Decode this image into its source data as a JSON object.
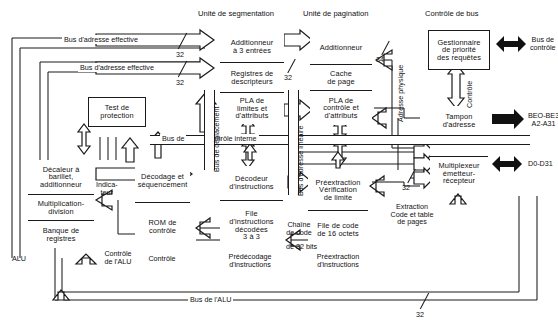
{
  "diagram": {
    "section_titles": {
      "segmentation": "Unité de segmentation",
      "pagination": "Unité de pagination",
      "bus_control": "Contrôle de bus"
    },
    "blocks": {
      "alu": {
        "shifter": "Décaleur à barillet, additionneur",
        "shifter_l1": "Décaleur à",
        "shifter_l2": "barillet,",
        "shifter_l3": "additionneur",
        "muldiv_l1": "Multiplication-",
        "muldiv_l2": "division",
        "regbank_l1": "Banque de",
        "regbank_l2": "registres",
        "caption": "ALU"
      },
      "protection": {
        "l1": "Test de",
        "l2": "protection"
      },
      "control": {
        "decode_l1": "Décodage et",
        "decode_l2": "séquencement",
        "rom_l1": "ROM de",
        "rom_l2": "contrôle",
        "caption": "Contrôle"
      },
      "instruction_decode": {
        "decoder_l1": "Décodeur",
        "decoder_l2": "d'instructions",
        "queue_l1": "File",
        "queue_l2": "d'instructions",
        "queue_l3": "décodées",
        "queue_l4": "3 à 3",
        "caption_l1": "Prédécodage",
        "caption_l2": "d'instructions"
      },
      "prefetch": {
        "limit_l1": "Préextraction",
        "limit_l2": "Vérification",
        "limit_l3": "de limite",
        "codequeue_l1": "File de code",
        "codequeue_l2": "de 16 octets",
        "caption_l1": "Préextraction",
        "caption_l2": "d'instructions"
      },
      "segmentation": {
        "adder_l1": "Additionneur",
        "adder_l2": "à 3 entrées",
        "descr_l1": "Registres de",
        "descr_l2": "descripteurs",
        "pla_l1": "PLA de",
        "pla_l2": "limites et",
        "pla_l3": "d'attributs"
      },
      "pagination": {
        "adder": "Additionneur",
        "cache_l1": "Cache",
        "cache_l2": "de page",
        "pla_l1": "PLA de",
        "pla_l2": "contrôle et",
        "pla_l3": "d'attributs"
      },
      "bus": {
        "requests_l1": "Gestionnaire",
        "requests_l2": "de priorité",
        "requests_l3": "des requêtes",
        "addrbuf_l1": "Tampon",
        "addrbuf_l2": "d'adresse",
        "spacer": "",
        "mux_l1": "Multiplexeur",
        "mux_l2": "émetteur-",
        "mux_l3": "récepteur"
      }
    },
    "bus_labels": {
      "effective_address_1": "Bus d'adresse effective",
      "effective_address_2": "Bus d'adresse effective",
      "internal_control": "Bus de       contrôle interne",
      "internal_control_a": "Bus de",
      "internal_control_b": "contrôle interne",
      "displacement": "Bus de déplacement",
      "linear_address": "Bus d'adresse linéaire",
      "physical_address": "Adresse physique",
      "control_vertical": "Contrôle",
      "alu_bus": "Bus de l'ALU"
    },
    "misc_labels": {
      "indicator_l1": "Indica-",
      "indicator_l2": "teur",
      "alu_control_l1": "Contrôle",
      "alu_control_l2": "de l'ALU",
      "code_chain_l1": "Chaîne",
      "code_chain_l2": "de code",
      "code_chain_l3": "de 32 bits",
      "extraction_l1": "Extraction",
      "extraction_l2": "Code et table",
      "extraction_l3": "de pages"
    },
    "external_signals": {
      "control_bus_l1": "Bus de",
      "control_bus_l2": "contrôle",
      "address_bus_l1": "BEO-BE3",
      "address_bus_l2": "A2-A31",
      "data_bus": "D0-D31"
    },
    "bus_widths": {
      "ea1": "32",
      "ea2": "32",
      "seg_out": "32",
      "pag_in": "34",
      "mux": "32",
      "alu": "32"
    },
    "colors": {
      "line": "#1b1b1b",
      "background": "#ffffff",
      "arrow_solid": "#111111"
    }
  }
}
